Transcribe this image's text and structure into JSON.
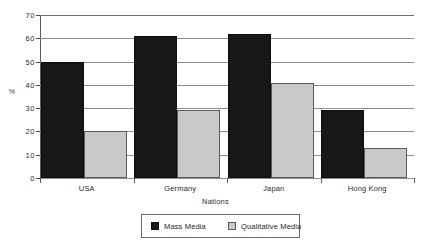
{
  "chart_data": {
    "type": "bar",
    "title": "",
    "subtitle": "",
    "xlabel": "Nations",
    "ylabel": "%",
    "categories": [
      "USA",
      "Germany",
      "Japan",
      "Hong Kong"
    ],
    "series": [
      {
        "name": "Mass Media",
        "color": "#171717",
        "values": [
          50,
          61,
          62,
          29
        ]
      },
      {
        "name": "Qualitative Media",
        "color": "#c9c9c9",
        "values": [
          20,
          29,
          41,
          13
        ]
      }
    ],
    "ylim": [
      0,
      70
    ],
    "ytick_step": 10,
    "yticks": [
      70,
      60,
      50,
      40,
      30,
      20,
      10,
      0
    ],
    "ytick_labels": [
      "70",
      "60",
      "50",
      "40",
      "30",
      "20",
      "10",
      "0"
    ],
    "grid": true,
    "grid_axis": "y",
    "legend": true,
    "legend_position": "bottom-center",
    "annotations": []
  }
}
